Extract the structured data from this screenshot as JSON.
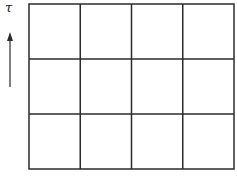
{
  "diagram": {
    "axis_label": "τ",
    "axis_direction": "up",
    "grid": {
      "rows": 3,
      "columns": 4,
      "left": 29,
      "top": 4,
      "right": 234,
      "bottom": 169,
      "line_color": "#2b2b2b"
    },
    "arrow": {
      "x": 10,
      "y_start": 87,
      "y_end": 32,
      "color": "#2b2b2b"
    }
  }
}
